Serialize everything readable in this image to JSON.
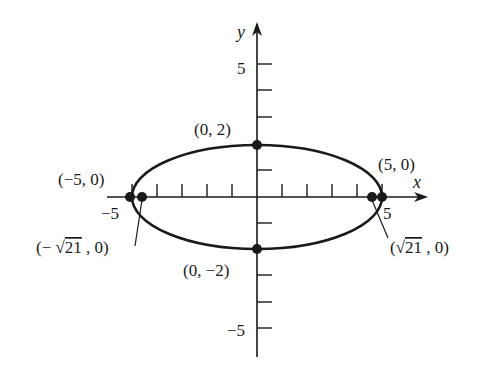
{
  "diagram": {
    "type": "ellipse-graph",
    "equation_shape": "horizontal ellipse centered at origin",
    "axes": {
      "x_label": "x",
      "y_label": "y",
      "x_tick_label_pos": "5",
      "x_tick_label_neg": "−5",
      "y_tick_label_pos": "5",
      "y_tick_label_neg": "−5",
      "x_range": [
        -6,
        6
      ],
      "y_range": [
        -6,
        7
      ]
    },
    "ellipse": {
      "center": [
        0,
        0
      ],
      "semi_major": 5,
      "semi_minor": 2,
      "color": "#1a1a1a"
    },
    "points": [
      {
        "id": "vertex-right",
        "label": "(5, 0)",
        "x": 5,
        "y": 0
      },
      {
        "id": "vertex-left",
        "label": "(−5, 0)",
        "x": -5,
        "y": 0
      },
      {
        "id": "covertex-top",
        "label": "(0, 2)",
        "x": 0,
        "y": 2
      },
      {
        "id": "covertex-bottom",
        "label": "(0, −2)",
        "x": 0,
        "y": -2
      },
      {
        "id": "focus-right",
        "label_prefix": "(",
        "label_radical": "√",
        "label_radicand": "21",
        "label_suffix": " , 0)",
        "x": 4.583,
        "y": 0
      },
      {
        "id": "focus-left",
        "label_prefix": "(− ",
        "label_radical": "√",
        "label_radicand": "21",
        "label_suffix": " , 0)",
        "x": -4.583,
        "y": 0
      }
    ]
  }
}
